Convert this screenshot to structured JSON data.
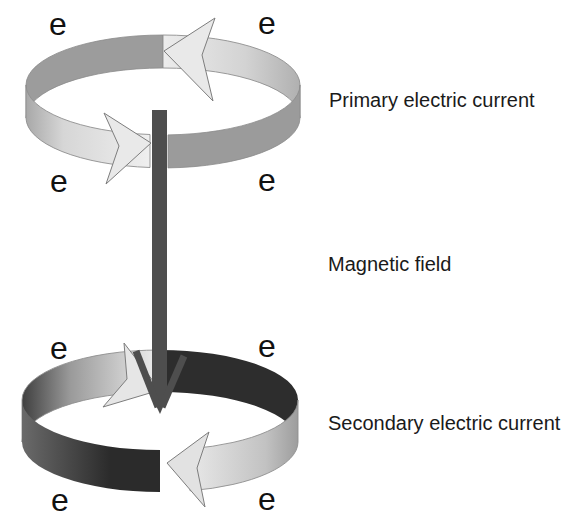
{
  "diagram": {
    "labels": {
      "primary": "Primary electric current",
      "magnetic": "Magnetic field",
      "secondary": "Secondary electric current"
    },
    "electron_symbol": "e",
    "colors": {
      "light_arrow": "#e9e9e9",
      "medium_gray_band": "#9c9c9c",
      "dark_band": "#2d2d2d",
      "field_arrow": "#4e4e4e",
      "text": "#1a1a1a",
      "background": "#ffffff"
    }
  }
}
